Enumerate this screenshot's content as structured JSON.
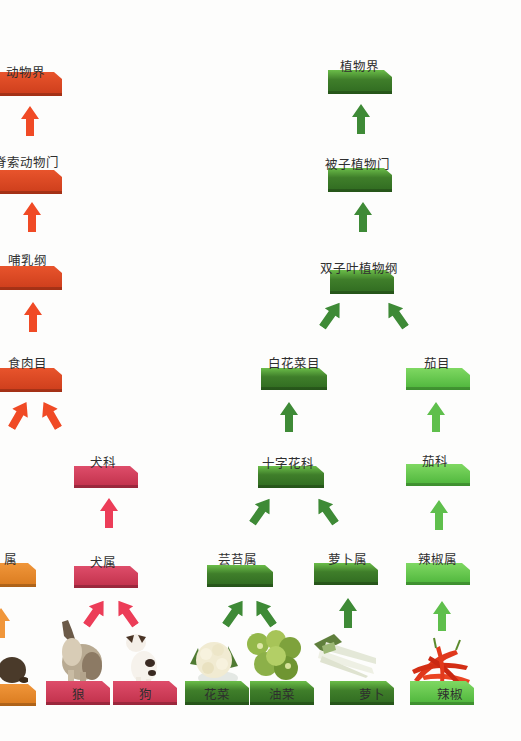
{
  "colors": {
    "bar": "#4c4a8a",
    "animal_upper": "#d9461f",
    "animal_dog": "#cf3b58",
    "plant_dark": "#3f7e2a",
    "plant_light": "#5cc443",
    "arrow_red": "#f04a25",
    "arrow_pink": "#ec3d58",
    "arrow_dgreen": "#3e8a36",
    "arrow_lgreen": "#5fbf4c"
  },
  "levels": [
    {
      "rank": "界",
      "animal": "动物界",
      "plants": [
        "植物界"
      ]
    },
    {
      "rank": "门",
      "animal": "脊索动物门",
      "plants": [
        "被子植物门"
      ]
    },
    {
      "rank": "纲",
      "animal": "哺乳纲",
      "plants": [
        "双子叶植物纲"
      ]
    },
    {
      "rank": "目",
      "animal": "食肉目",
      "plants": [
        "白花菜目",
        "茄目"
      ]
    },
    {
      "rank": "科",
      "animal": "犬科",
      "plants": [
        "十字花科",
        "茄科"
      ]
    },
    {
      "rank": "属",
      "animal_partial": "属",
      "animal": "犬属",
      "plants": [
        "芸苔属",
        "萝卜属",
        "辣椒属"
      ]
    },
    {
      "rank": "种",
      "animal_partial": "",
      "species": [
        "狼",
        "狗",
        "花菜",
        "油菜",
        "萝卜",
        "辣椒"
      ]
    }
  ],
  "diagram": {
    "kingdom_animal": "动物界",
    "kingdom_plant": "植物界",
    "phylum_animal": "脊索动物门",
    "phylum_plant": "被子植物门",
    "class_animal": "哺乳纲",
    "class_plant": "双子叶植物纲",
    "order_animal": "食肉目",
    "order_plant_1": "白花菜目",
    "order_plant_2": "茄目",
    "family_animal": "犬科",
    "family_plant_1": "十字花科",
    "family_plant_2": "茄科",
    "genus_partial": "属",
    "genus_animal": "犬属",
    "genus_plant_1": "芸苔属",
    "genus_plant_2": "萝卜属",
    "genus_plant_3": "辣椒属",
    "species_partial": "",
    "species_wolf": "狼",
    "species_dog": "狗",
    "species_cauliflower": "花菜",
    "species_rape": "油菜",
    "species_radish": "萝卜",
    "species_pepper": "辣椒"
  }
}
